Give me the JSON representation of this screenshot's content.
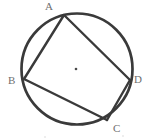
{
  "figure": {
    "type": "geometry-diagram",
    "background_color": "#ffffff",
    "stroke_color": "#3a3a3a",
    "label_color": "#6f6f6f",
    "circle": {
      "name": "circumscribed-circle",
      "center_x": 77,
      "center_y": 69,
      "radius": 56,
      "stroke_width": 2.6
    },
    "center_dot": {
      "name": "circle-center-dot",
      "x": 76,
      "y": 69,
      "radius": 1.3
    },
    "vertices": [
      {
        "id": "A",
        "label": "A",
        "x": 64,
        "y": 15,
        "label_x": 45,
        "label_y": 1
      },
      {
        "id": "B",
        "label": "B",
        "x": 24,
        "y": 79,
        "label_x": 8,
        "label_y": 75
      },
      {
        "id": "C",
        "label": "C",
        "x": 107,
        "y": 120,
        "label_x": 113,
        "label_y": 123
      },
      {
        "id": "D",
        "label": "D",
        "x": 130,
        "y": 80,
        "label_x": 134,
        "label_y": 74
      }
    ],
    "edges": [
      {
        "id": "AB",
        "from": "A",
        "to": "B",
        "stroke_width": 2.4
      },
      {
        "id": "AD",
        "from": "A",
        "to": "D",
        "stroke_width": 2.4
      },
      {
        "id": "BC",
        "from": "B",
        "to": "C",
        "stroke_width": 2.4
      },
      {
        "id": "CD",
        "from": "C",
        "to": "D",
        "stroke_width": 2.4
      }
    ]
  }
}
